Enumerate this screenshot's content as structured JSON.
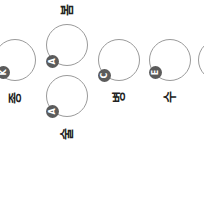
{
  "nodes": [
    {
      "id": "left",
      "label": "종",
      "badge": "K",
      "cx": 15,
      "cy": 60,
      "bx": 3,
      "by": 72,
      "lx": 5,
      "ly": 90
    },
    {
      "id": "top-center",
      "label": "봄",
      "badge": "A",
      "cx": 67,
      "cy": 45,
      "bx": 52,
      "by": 59,
      "lx": 57,
      "ly": 2
    },
    {
      "id": "bottom-center",
      "label": "술",
      "badge": "A",
      "cx": 67,
      "cy": 96,
      "bx": 52,
      "by": 109,
      "lx": 57,
      "ly": 127
    },
    {
      "id": "middle",
      "label": "병",
      "badge": "C",
      "cx": 119,
      "cy": 60,
      "bx": 103,
      "by": 72,
      "lx": 109,
      "ly": 90
    },
    {
      "id": "right",
      "label": "수",
      "badge": "E",
      "cx": 170,
      "cy": 60,
      "bx": 155,
      "by": 69,
      "lx": 160,
      "ly": 90
    },
    {
      "id": "far-right",
      "label": "",
      "badge": "",
      "cx": 220,
      "cy": 60
    }
  ],
  "colors": {
    "ring": "#9a9a9a",
    "badge": "#5b5b5b",
    "text": "#222222"
  }
}
